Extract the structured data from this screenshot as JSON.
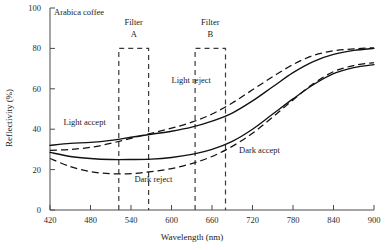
{
  "chart_data": {
    "type": "line",
    "title": "Arabica coffee",
    "xlabel": "Wavelength (nm)",
    "ylabel": "Reflectivity (%)",
    "xlim": [
      420,
      900
    ],
    "ylim": [
      0,
      100
    ],
    "xticks": [
      420,
      480,
      540,
      600,
      660,
      720,
      780,
      840,
      900
    ],
    "yticks": [
      0,
      20,
      40,
      60,
      80,
      100
    ],
    "grid": false,
    "legend": "inline-annotations",
    "series": [
      {
        "name": "Light accept",
        "style": "solid",
        "x": [
          420,
          450,
          480,
          510,
          540,
          570,
          600,
          630,
          660,
          690,
          720,
          750,
          780,
          810,
          840,
          870,
          900
        ],
        "values": [
          32,
          33,
          33.5,
          34.5,
          36,
          37.5,
          39,
          41,
          44,
          48,
          54,
          61,
          68,
          73.5,
          77,
          79,
          80
        ]
      },
      {
        "name": "Light reject",
        "style": "dashed",
        "x": [
          420,
          450,
          480,
          510,
          540,
          570,
          600,
          630,
          660,
          690,
          720,
          750,
          780,
          810,
          840,
          870,
          900
        ],
        "values": [
          29.5,
          30,
          31,
          33,
          35.5,
          38,
          40.5,
          43.5,
          47.5,
          53,
          59.5,
          66,
          72,
          76.5,
          78.8,
          79.8,
          80.3
        ]
      },
      {
        "name": "Dark accept",
        "style": "solid",
        "x": [
          420,
          450,
          480,
          510,
          540,
          570,
          600,
          630,
          660,
          690,
          720,
          750,
          780,
          810,
          840,
          870,
          900
        ],
        "values": [
          28.5,
          26.5,
          25.5,
          25,
          25,
          25.2,
          26,
          27.5,
          30,
          34,
          40,
          47.5,
          55,
          62,
          67.5,
          70.5,
          72
        ]
      },
      {
        "name": "Dark reject",
        "style": "dashed",
        "x": [
          420,
          450,
          480,
          510,
          540,
          570,
          600,
          630,
          660,
          690,
          720,
          750,
          780,
          810,
          840,
          870,
          900
        ],
        "values": [
          25.5,
          21.5,
          19,
          18,
          18,
          19,
          20.5,
          23,
          26.5,
          31.5,
          38,
          46,
          54.5,
          62.5,
          68.5,
          71.5,
          73
        ]
      }
    ],
    "filters": [
      {
        "label": "Filter",
        "sub": "A",
        "x_start": 522,
        "x_end": 566,
        "top": 80
      },
      {
        "label": "Filter",
        "sub": "B",
        "x_start": 635,
        "x_end": 680,
        "top": 80
      }
    ],
    "annotations": [
      {
        "text": "Arabica coffee",
        "x": 445,
        "y": 97
      },
      {
        "text": "Light accept",
        "x": 440,
        "y": 42
      },
      {
        "text": "Light reject",
        "x": 600,
        "y": 63
      },
      {
        "text": "Dark reject",
        "x": 545,
        "y": 14
      },
      {
        "text": "Dark accept",
        "x": 700,
        "y": 28
      }
    ]
  },
  "labels": {
    "title": "Arabica coffee",
    "ylabel": "Reflectivity (%)",
    "xlabel": "Wavelength (nm)",
    "light_accept": "Light accept",
    "light_reject": "Light reject",
    "dark_accept": "Dark accept",
    "dark_reject": "Dark reject",
    "filter_a_name": "Filter",
    "filter_a_sub": "A",
    "filter_b_name": "Filter",
    "filter_b_sub": "B",
    "y_100": "100",
    "y_80": "80",
    "y_60": "60",
    "y_40": "40",
    "y_20": "20",
    "y_0": "0",
    "x_420": "420",
    "x_480": "480",
    "x_540": "540",
    "x_600": "600",
    "x_660": "660",
    "x_720": "720",
    "x_780": "780",
    "x_840": "840",
    "x_900": "900"
  }
}
